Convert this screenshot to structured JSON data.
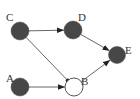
{
  "diagram": {
    "type": "directed-graph",
    "colors": {
      "filled_node": "#474747",
      "hollow_node_fill": "#ffffff",
      "hollow_node_stroke": "#555555",
      "edge": "#555555",
      "label": "#333333"
    },
    "nodes": [
      {
        "id": "C",
        "label": "C",
        "x": 20,
        "y": 31,
        "r": 9,
        "filled": true,
        "label_x": 6,
        "label_y": 17
      },
      {
        "id": "D",
        "label": "D",
        "x": 73,
        "y": 30,
        "r": 9,
        "filled": true,
        "label_x": 78,
        "label_y": 17
      },
      {
        "id": "E",
        "label": "E",
        "x": 117,
        "y": 55,
        "r": 8.5,
        "filled": true,
        "label_x": 125,
        "label_y": 50
      },
      {
        "id": "A",
        "label": "A",
        "x": 20,
        "y": 87,
        "r": 9,
        "filled": true,
        "label_x": 6,
        "label_y": 78
      },
      {
        "id": "B",
        "label": "B",
        "x": 74,
        "y": 87,
        "r": 9,
        "filled": false,
        "label_x": 81,
        "label_y": 81
      }
    ],
    "edges": [
      {
        "from": "C",
        "to": "D",
        "arrow": "triangle"
      },
      {
        "from": "D",
        "to": "E",
        "arrow": "triangle"
      },
      {
        "from": "C",
        "to": "B",
        "arrow": "dot"
      },
      {
        "from": "A",
        "to": "B",
        "arrow": "triangle"
      },
      {
        "from": "B",
        "to": "E",
        "arrow": "triangle"
      }
    ]
  }
}
